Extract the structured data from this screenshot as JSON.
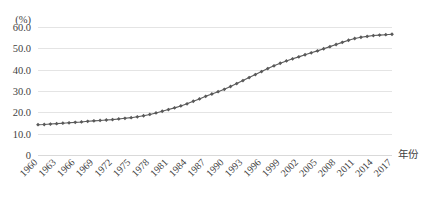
{
  "chart_data": {
    "type": "line",
    "title": "",
    "subtitle": "",
    "xlabel": "年份",
    "ylabel": "",
    "unit_label": "(%)",
    "grid": true,
    "legend": false,
    "legend_position": "none",
    "xlim": [
      1960,
      2017
    ],
    "ylim": [
      0,
      60
    ],
    "ytick_labels": [
      "60.0",
      "50.0",
      "40.0",
      "30.0",
      "20.0",
      "10.0",
      "0"
    ],
    "ytick_values": [
      60,
      50,
      40,
      30,
      20,
      10,
      0
    ],
    "xtick_labels": [
      "1960",
      "1963",
      "1966",
      "1969",
      "1972",
      "1975",
      "1978",
      "1981",
      "1984",
      "1987",
      "1990",
      "1993",
      "1996",
      "1999",
      "2002",
      "2005",
      "2008",
      "2011",
      "2014",
      "2017"
    ],
    "xtick_values": [
      1960,
      1963,
      1966,
      1969,
      1972,
      1975,
      1978,
      1981,
      1984,
      1987,
      1990,
      1993,
      1996,
      1999,
      2002,
      2005,
      2008,
      2011,
      2014,
      2017
    ],
    "marker": "diamond",
    "series_color": "#595959",
    "grid_color": "#e4e4e4",
    "x": [
      1960,
      1961,
      1962,
      1963,
      1964,
      1965,
      1966,
      1967,
      1968,
      1969,
      1970,
      1971,
      1972,
      1973,
      1974,
      1975,
      1976,
      1977,
      1978,
      1979,
      1980,
      1981,
      1982,
      1983,
      1984,
      1985,
      1986,
      1987,
      1988,
      1989,
      1990,
      1991,
      1992,
      1993,
      1994,
      1995,
      1996,
      1997,
      1998,
      1999,
      2000,
      2001,
      2002,
      2003,
      2004,
      2005,
      2006,
      2007,
      2008,
      2009,
      2010,
      2011,
      2012,
      2013,
      2014,
      2015,
      2016,
      2017
    ],
    "values": [
      14.2,
      14.3,
      14.5,
      14.7,
      14.9,
      15.1,
      15.3,
      15.5,
      15.8,
      16.0,
      16.2,
      16.4,
      16.6,
      16.9,
      17.2,
      17.5,
      17.9,
      18.4,
      19.0,
      19.7,
      20.5,
      21.3,
      22.1,
      23.0,
      24.0,
      25.2,
      26.3,
      27.5,
      28.6,
      29.7,
      30.8,
      32.1,
      33.5,
      34.9,
      36.3,
      37.7,
      39.1,
      40.5,
      41.8,
      43.0,
      44.1,
      45.1,
      46.0,
      47.0,
      47.9,
      48.8,
      49.8,
      50.8,
      51.8,
      52.8,
      53.8,
      54.6,
      55.2,
      55.6,
      56.0,
      56.2,
      56.4,
      56.6
    ],
    "annotations": []
  },
  "figure": {
    "background_color": "#ffffff",
    "text_color": "#3f3f3f"
  }
}
